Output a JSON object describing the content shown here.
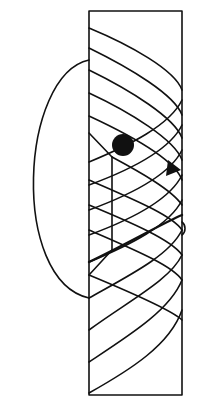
{
  "diagram": {
    "colors": {
      "background": "#ffffff",
      "ink": "#111111"
    },
    "frame": {
      "outline_points": [
        [
          89,
          11
        ],
        [
          182,
          11
        ],
        [
          182,
          395
        ],
        [
          89,
          395
        ],
        [
          89,
          275
        ],
        [
          89,
          250
        ],
        [
          89,
          157
        ],
        [
          89,
          133
        ],
        [
          89,
          11
        ]
      ],
      "notch": {
        "top": [
          [
            89,
            133
          ],
          [
            112,
            157
          ]
        ],
        "bottom": [
          [
            112,
            250
          ],
          [
            89,
            275
          ]
        ]
      }
    },
    "front_helix_paths": [
      "M89,28 C130,45 175,70 182,90",
      "M89,48 C130,68 175,95 182,115",
      "M89,70 C130,90 175,118 182,138",
      "M89,93 C130,112 175,140 182,160",
      "M89,116 C130,135 175,160 182,180",
      "M112,157 C140,172 172,190 182,205",
      "M89,180 C130,198 172,215 182,230",
      "M89,205 C130,222 172,240 182,255",
      "M89,230 C130,248 172,265 182,280",
      "M89,275 C130,292 172,310 182,320"
    ],
    "back_helix_paths": [
      "M182,100 C170,125 130,145 89,162",
      "M182,125 C170,150 130,170 89,185",
      "M182,150 C170,175 130,195 89,210",
      "M182,175 C170,200 130,220 89,235",
      "M182,200 C170,225 130,245 89,262",
      "M182,230 C170,255 130,275 89,298",
      "M182,255 C170,280 130,300 89,330",
      "M182,280 C170,310 130,335 89,362",
      "M182,310 C170,345 130,370 89,393"
    ],
    "highlighted_path": "M89,262 C125,245 165,222 182,215",
    "return_loop": "M89,60 C20,75 10,280 89,298",
    "ball": {
      "cx": 123,
      "cy": 145,
      "r": 11
    },
    "arrow": {
      "points": "168,160 181,170 166,176"
    },
    "bump": "M182,222 C186,225 186,232 182,235"
  }
}
